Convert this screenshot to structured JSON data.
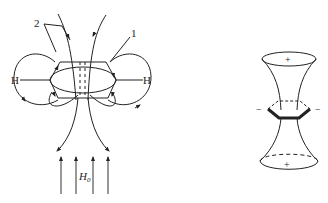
{
  "figure_left": {
    "title": "Ring current induced in benzene by applied field",
    "labels": {
      "ring_label": "1",
      "field_line_label": "2",
      "proton_left": "H",
      "proton_right": "H",
      "applied_field": "H",
      "applied_field_subscript": "0"
    },
    "applied_field_arrow_count": 4
  },
  "figure_right": {
    "title": "Shielding cones of benzene",
    "labels": {
      "top_cone_sign": "+",
      "bottom_cone_sign": "+",
      "left_sign": "−",
      "right_sign": "−"
    }
  },
  "colors": {
    "ink": "#222222",
    "background": "#ffffff"
  }
}
